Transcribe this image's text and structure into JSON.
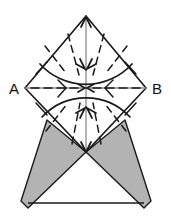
{
  "figure": {
    "background_color": "#ffffff",
    "width": 171,
    "height": 223,
    "labels": {
      "left_vertex": "A",
      "right_vertex": "B"
    },
    "colors": {
      "outline": "#1a1a1a",
      "shaded_fill": "#b3b3b3",
      "shaded_stroke": "#1a1a1a",
      "axis_line": "#8c8c8c",
      "dashed_line": "#1a1a1a",
      "arc_line": "#1a1a1a",
      "label_color": "#111111"
    },
    "geometry": {
      "square": {
        "top": [
          86,
          16
        ],
        "right": [
          146,
          88
        ],
        "bottom": [
          86,
          152
        ],
        "left": [
          25,
          88
        ]
      },
      "center": [
        86,
        88
      ],
      "upper_arc_radius": 62,
      "lower_arc_radius": 60,
      "base_line": {
        "from": [
          28,
          203
        ],
        "to": [
          144,
          203
        ]
      },
      "left_shaded_triangle": [
        [
          47,
          120
        ],
        [
          86,
          152
        ],
        [
          28,
          208
        ]
      ],
      "right_shaded_triangle": [
        [
          125,
          120
        ],
        [
          86,
          152
        ],
        [
          144,
          208
        ]
      ]
    },
    "arrows": {
      "vertical_axis": {
        "from": [
          86,
          152
        ],
        "to": [
          86,
          16
        ],
        "heads": "both"
      },
      "horizontal_axis": {
        "from": [
          25,
          88
        ],
        "to": [
          146,
          88
        ],
        "heads": "both"
      },
      "count_upper_radial": 4,
      "count_lower_radial": 4,
      "count_center_converging": 4
    }
  }
}
